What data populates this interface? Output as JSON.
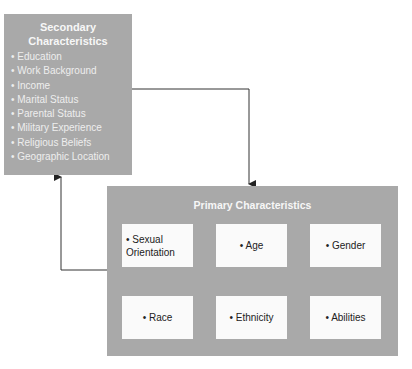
{
  "secondary": {
    "title": "Secondary Characteristics",
    "items": [
      "Education",
      "Work Background",
      "Income",
      "Marital Status",
      "Parental Status",
      "Military Experience",
      "Religious Beliefs",
      "Geographic Location"
    ]
  },
  "primary": {
    "title": "Primary Characteristics",
    "items": [
      "Sexual Orientation",
      "Age",
      "Gender",
      "Race",
      "Ethnicity",
      "Abilities"
    ]
  },
  "colors": {
    "box": "#a9a9a9",
    "inner": "#fafafa",
    "line": "#333333"
  }
}
